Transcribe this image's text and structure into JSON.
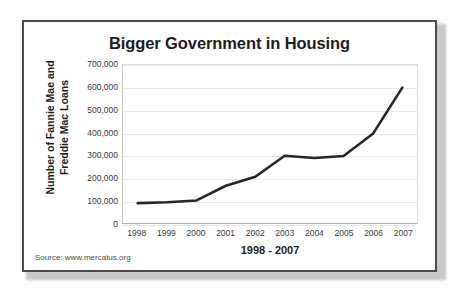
{
  "figure": {
    "source_note": "Source: www.mercatus.org"
  },
  "chart_data": {
    "type": "line",
    "title": "Bigger Government in Housing",
    "xlabel": "1998 - 2007",
    "ylabel": "Number of Fannie Mae and Freddie Mac Loans",
    "ylabel_line1": "Number of Fannie Mae and",
    "ylabel_line2": "Freddie Mac Loans",
    "categories": [
      "1998",
      "1999",
      "2000",
      "2001",
      "2002",
      "2003",
      "2004",
      "2005",
      "2006",
      "2007"
    ],
    "values": [
      88000,
      92000,
      100000,
      165000,
      205000,
      298000,
      288000,
      297000,
      395000,
      600000
    ],
    "ylim": [
      0,
      700000
    ],
    "yticks": [
      0,
      100000,
      200000,
      300000,
      400000,
      500000,
      600000,
      700000
    ],
    "ytick_labels": [
      "0",
      "100,000",
      "200,000",
      "300,000",
      "400,000",
      "500,000",
      "600,000",
      "700,000"
    ],
    "grid": true,
    "legend": "none",
    "series_color": "#262626",
    "grid_color": "#e8e8e8"
  }
}
